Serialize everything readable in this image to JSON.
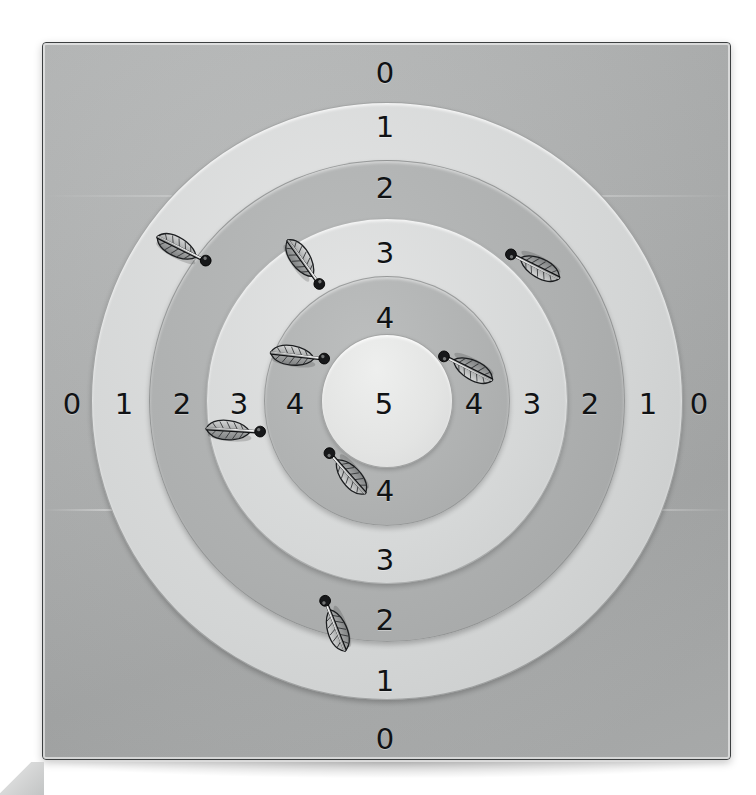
{
  "scene": {
    "title": "Archery target board with arrows",
    "background_color": "#ffffff",
    "mat_color": "#aeb0b0",
    "mat_border_color": "#3c3f40"
  },
  "target": {
    "center_x": 385,
    "center_y": 400,
    "ring_count": 6,
    "bullseye_value": "5",
    "rings": [
      {
        "name": "ring-5-bullseye",
        "score": "5",
        "fill": "#e3e4e3",
        "width": 130,
        "height": 132
      },
      {
        "name": "ring-4",
        "score": "4",
        "fill": "#b0b2b2",
        "width": 244,
        "height": 248
      },
      {
        "name": "ring-3",
        "score": "3",
        "fill": "#d6d8d8",
        "width": 360,
        "height": 364
      },
      {
        "name": "ring-2",
        "score": "2",
        "fill": "#adafaf",
        "width": 474,
        "height": 480
      },
      {
        "name": "ring-1",
        "score": "1",
        "fill": "#d3d5d5",
        "width": 590,
        "height": 596
      },
      {
        "name": "ring-0-field",
        "score": "0",
        "fill": "#aeb0b0",
        "width": 687,
        "height": 716
      }
    ]
  },
  "labels": {
    "vertical_top": [
      "0",
      "1",
      "2",
      "3",
      "4"
    ],
    "vertical_bottom": [
      "4",
      "3",
      "2",
      "1",
      "0"
    ],
    "horizontal": [
      "0",
      "1",
      "2",
      "3",
      "4",
      "5",
      "4",
      "3",
      "2",
      "1",
      "0"
    ],
    "center": "5",
    "positions": {
      "vertical_top": [
        {
          "x": 385,
          "y": 73
        },
        {
          "x": 385,
          "y": 127
        },
        {
          "x": 385,
          "y": 188
        },
        {
          "x": 385,
          "y": 253
        },
        {
          "x": 385,
          "y": 318
        }
      ],
      "vertical_bottom": [
        {
          "x": 385,
          "y": 491
        },
        {
          "x": 385,
          "y": 560
        },
        {
          "x": 385,
          "y": 620
        },
        {
          "x": 385,
          "y": 681
        },
        {
          "x": 385,
          "y": 739
        }
      ],
      "horizontal": [
        {
          "x": 72,
          "y": 404
        },
        {
          "x": 124,
          "y": 404
        },
        {
          "x": 182,
          "y": 404
        },
        {
          "x": 239,
          "y": 404
        },
        {
          "x": 295,
          "y": 404
        },
        {
          "x": 384,
          "y": 404
        },
        {
          "x": 474,
          "y": 404
        },
        {
          "x": 532,
          "y": 404
        },
        {
          "x": 590,
          "y": 404
        },
        {
          "x": 648,
          "y": 404
        },
        {
          "x": 699,
          "y": 404
        }
      ]
    }
  },
  "arrows": {
    "count": 8,
    "fletch_color": "#9a9c9c",
    "nock_color": "#17181a",
    "items": [
      {
        "name": "arrow-left-outer",
        "tip_x": 205,
        "tip_y": 262,
        "angle": 28,
        "scored_ring": "2"
      },
      {
        "name": "arrow-right-outer",
        "tip_x": 511,
        "tip_y": 253,
        "angle": 208,
        "scored_ring": "2"
      },
      {
        "name": "arrow-upper-center",
        "tip_x": 318,
        "tip_y": 285,
        "angle": 56,
        "scored_ring": "3"
      },
      {
        "name": "arrow-right-inner",
        "tip_x": 444,
        "tip_y": 355,
        "angle": 208,
        "scored_ring": "4"
      },
      {
        "name": "arrow-left-inner-mid",
        "tip_x": 324,
        "tip_y": 360,
        "angle": 8,
        "scored_ring": "4"
      },
      {
        "name": "arrow-left-inner-low",
        "tip_x": 260,
        "tip_y": 433,
        "angle": 5,
        "scored_ring": "3"
      },
      {
        "name": "arrow-lower-center",
        "tip_x": 330,
        "tip_y": 452,
        "angle": 230,
        "scored_ring": "4"
      },
      {
        "name": "arrow-bottom",
        "tip_x": 326,
        "tip_y": 600,
        "angle": 250,
        "scored_ring": "2"
      }
    ]
  }
}
